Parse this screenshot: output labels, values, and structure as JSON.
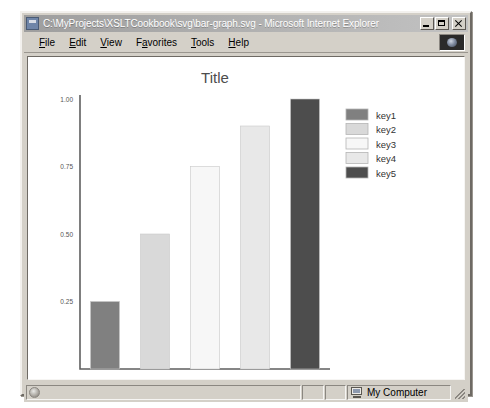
{
  "window": {
    "title": "C:\\MyProjects\\XSLTCookbook\\svg\\bar-graph.svg - Microsoft Internet Explorer",
    "title_icon": "svg-document-icon",
    "buttons": {
      "minimize": "minimize-button",
      "maximize": "maximize-button",
      "close": "close-button"
    }
  },
  "menu": {
    "items": [
      {
        "label": "File",
        "accel": "F"
      },
      {
        "label": "Edit",
        "accel": "E"
      },
      {
        "label": "View",
        "accel": "V"
      },
      {
        "label": "Favorites",
        "accel": "a"
      },
      {
        "label": "Tools",
        "accel": "T"
      },
      {
        "label": "Help",
        "accel": "H"
      }
    ],
    "logo": "ie-logo-animation"
  },
  "status": {
    "document_icon": "page-status-icon",
    "zone_icon": "my-computer-icon",
    "zone_label": "My Computer",
    "resize_grip": "resize-grip"
  },
  "chart_data": {
    "type": "bar",
    "title": "Title",
    "xlabel": "",
    "ylabel": "",
    "categories": [
      "key1",
      "key2",
      "key3",
      "key4",
      "key5"
    ],
    "values": [
      0.25,
      0.5,
      0.75,
      0.9,
      1.0
    ],
    "ylim": [
      0,
      1.0
    ],
    "yticks": [
      0.25,
      0.5,
      0.75,
      1.0
    ],
    "ytick_labels": [
      "0.25",
      "0.50",
      "0.75",
      "1.00"
    ],
    "grid": false,
    "legend": {
      "position": "right",
      "entries": [
        {
          "label": "key1",
          "color": "#808080"
        },
        {
          "label": "key2",
          "color": "#d9d9d9"
        },
        {
          "label": "key3",
          "color": "#f7f7f7"
        },
        {
          "label": "key4",
          "color": "#e8e8e8"
        },
        {
          "label": "key5",
          "color": "#4d4d4d"
        }
      ]
    },
    "bar_colors": [
      "#808080",
      "#d9d9d9",
      "#f7f7f7",
      "#e8e8e8",
      "#4d4d4d"
    ],
    "axis_color": "#5f5f5f",
    "title_color": "#4d4d4d"
  }
}
